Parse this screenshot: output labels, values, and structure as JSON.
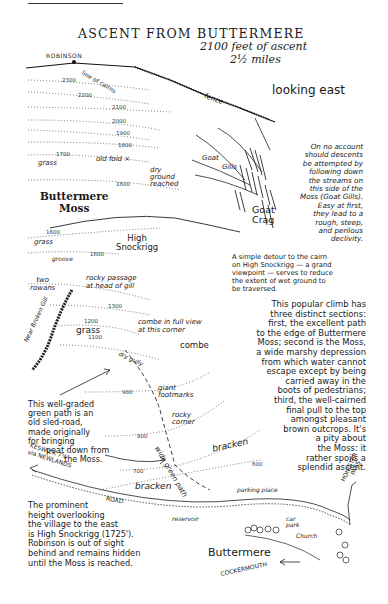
{
  "header": {
    "title": "ASCENT FROM BUTTERMERE",
    "ascent": "2100 feet of ascent",
    "distance": "2½ miles",
    "orientation": "looking east"
  },
  "summit": {
    "name": "ROBINSON"
  },
  "contours": [
    "2300",
    "2200",
    "2100",
    "2000",
    "1900",
    "1800",
    "1700",
    "1600",
    "1600",
    "1600",
    "1300",
    "1200",
    "1100",
    "900",
    "800",
    "700",
    "600"
  ],
  "labels": {
    "line_of_cairns": "line of cairns",
    "fence": "fence",
    "grass_top": "grass",
    "old_fold": "old fold ×",
    "dry_ground": [
      "dry",
      "ground",
      "reached"
    ],
    "buttermere_moss": [
      "Buttermere",
      "Moss"
    ],
    "goat_gills": [
      "Goat",
      "Gills"
    ],
    "goat_crag": [
      "Goat",
      "Crag"
    ],
    "grass_mid": "grass",
    "groove": "groove",
    "high_snockrigg": [
      "High",
      "Snockrigg"
    ],
    "two_rowans": [
      "two",
      "rowans"
    ],
    "rocky_passage": [
      "rocky passage",
      "at head of gill"
    ],
    "near_broken_gill": "Near Broken Gill",
    "combe_view": [
      "combe in full view",
      "at this corner"
    ],
    "grass_low": "grass",
    "combe": "combe",
    "dry_gully": "dry gully",
    "giant_footmarks": [
      "giant",
      "footmarks"
    ],
    "rocky_corner": [
      "rocky",
      "corner"
    ],
    "wide_green_path": "wide green path",
    "bracken_upper": "bracken",
    "bracken_lower": "bracken",
    "road": "ROAD",
    "keswick": [
      "KESWICK 7½",
      "via NEWLANDS"
    ],
    "parking_place": "parking place",
    "reservoir": "reservoir",
    "car_park": [
      "car",
      "park"
    ],
    "church": "Church",
    "honister_pass": [
      "HONISTER",
      "PASS"
    ],
    "buttermere": "Buttermere",
    "cockermouth": "COCKERMOUTH"
  },
  "notes": {
    "goat_gills_warning": [
      "On no account",
      "should descents",
      "be attempted by",
      "following down",
      "the streams on",
      "this side of the",
      "Moss (Goat Gills).",
      "Easy at first,",
      "they lead to a",
      "rough, steep,",
      "and perilous",
      "declivity."
    ],
    "detour": [
      "A simple detour to the cairn",
      "on High Snockrigg — a grand",
      "viewpoint — serves to reduce",
      "the extent of wet ground to",
      "be traversed."
    ],
    "climb_sections": [
      "This popular climb has",
      "three distinct sections:",
      "first, the excellent path",
      "to the edge of Buttermere",
      "Moss; second is the Moss,",
      "a wide marshy depression",
      "from which water cannot",
      "escape except by being",
      "carried away in the",
      "boots of pedestrians;",
      "third, the well-cairned",
      "final pull to the top",
      "amongst pleasant",
      "brown outcrops. It's",
      "a pity about",
      "the Moss: it",
      "rather spoils a",
      "splendid ascent."
    ],
    "sled_road": [
      "This well-graded",
      "green path is an",
      "old sled-road,",
      "made originally",
      "for bringing",
      "peat down from",
      "the Moss."
    ],
    "prominent_height": [
      "The prominent",
      "height overlooking",
      "the village to the east",
      "is High Snockrigg (1725').",
      "Robinson is out of sight",
      "behind and remains hidden",
      "until the Moss is reached."
    ]
  }
}
